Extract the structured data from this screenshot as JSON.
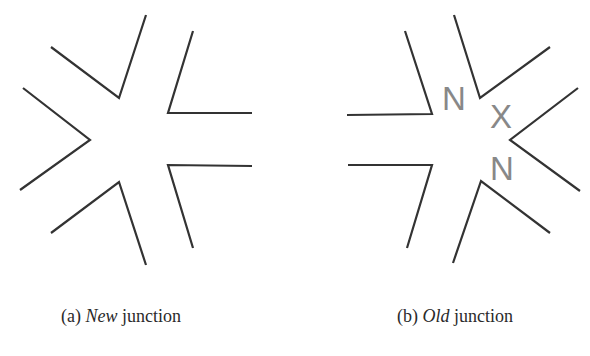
{
  "figure": {
    "subfigures": [
      {
        "id": "a",
        "caption_prefix": "(a) ",
        "caption_emph": "New",
        "caption_suffix": " junction",
        "polylines": [
          [
            [
              51,
              47
            ],
            [
              119,
              98
            ],
            [
              146,
              15
            ]
          ],
          [
            [
              193,
              31
            ],
            [
              168,
              113
            ],
            [
              252,
              113
            ]
          ],
          [
            [
              23,
              88
            ],
            [
              90,
              140
            ],
            [
              20,
              190
            ]
          ],
          [
            [
              252,
              166
            ],
            [
              168,
              165
            ],
            [
              193,
              248
            ]
          ],
          [
            [
              51,
              233
            ],
            [
              119,
              182
            ],
            [
              146,
              265
            ]
          ]
        ],
        "labels": []
      },
      {
        "id": "b",
        "caption_prefix": "(b) ",
        "caption_emph": "Old",
        "caption_suffix": " junction",
        "polylines": [
          [
            [
              347,
              115
            ],
            [
              432,
              114
            ],
            [
              405,
              31
            ]
          ],
          [
            [
              348,
              165
            ],
            [
              432,
              165
            ],
            [
              407,
              248
            ]
          ],
          [
            [
              454,
              15
            ],
            [
              480,
              98
            ],
            [
              550,
              47
            ]
          ],
          [
            [
              578,
              88
            ],
            [
              510,
              140
            ],
            [
              580,
              191
            ]
          ],
          [
            [
              453,
              263
            ],
            [
              481,
              181
            ],
            [
              550,
              233
            ]
          ]
        ],
        "labels": [
          {
            "text": "N",
            "x": 442,
            "y": 110
          },
          {
            "text": "X",
            "x": 490,
            "y": 128
          },
          {
            "text": "N",
            "x": 490,
            "y": 180
          }
        ]
      }
    ],
    "colors": {
      "stroke": "#333333",
      "label": "#888888",
      "background": "#ffffff"
    }
  }
}
